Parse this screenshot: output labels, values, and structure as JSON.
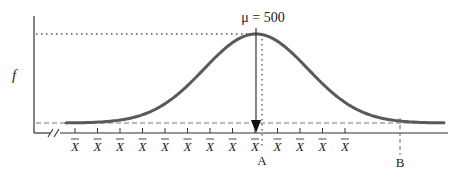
{
  "chart_data": {
    "type": "line",
    "title": "",
    "subtitle": "Normal sampling distribution of the sample mean",
    "xlabel": "",
    "ylabel": "f",
    "mean_label": "μ = 500",
    "mean_value": 500,
    "axis_break": true,
    "tick_label": "X̄",
    "tick_count": 13,
    "tick_labels": [
      "X̄",
      "X̄",
      "X̄",
      "X̄",
      "X̄",
      "X̄",
      "X̄",
      "X̄",
      "X̄",
      "X̄",
      "X̄",
      "X̄",
      "X̄"
    ],
    "markers": [
      {
        "label": "A",
        "position": "just right of the mean",
        "style": "dotted vertical line"
      },
      {
        "label": "B",
        "position": "right tail",
        "style": "dashed vertical line"
      }
    ],
    "reference_lines": [
      {
        "type": "horizontal",
        "style": "dotted",
        "meaning": "peak density level"
      },
      {
        "type": "horizontal",
        "style": "dashed",
        "meaning": "tail asymptote level"
      },
      {
        "type": "vertical",
        "style": "solid arrow",
        "meaning": "mean μ = 500"
      }
    ],
    "curve": {
      "shape": "normal (bell)",
      "color": "#5a5a5a"
    },
    "grid": false,
    "legend": null
  },
  "labels": {
    "mu": "μ = 500",
    "f": "f",
    "xbar": "X̄",
    "A": "A",
    "B": "B"
  },
  "colors": {
    "curve": "#5a5a5a",
    "axes": "#333333",
    "text": "#222222",
    "reference": "#555555"
  }
}
